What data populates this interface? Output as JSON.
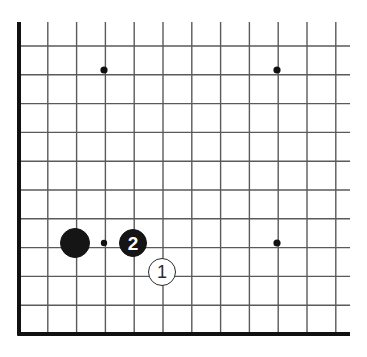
{
  "figure": {
    "type": "go-board-diagram",
    "title": "",
    "width": 367,
    "height": 357,
    "background_color": "#ffffff"
  },
  "board": {
    "line_color": "#5a5a5a",
    "edge_color": "#111111",
    "line_width": 1.4,
    "edge_line_width": 4,
    "spacing": 28.8,
    "origin_x": 19,
    "origin_y": 334,
    "visible_columns": 12,
    "visible_rows": 11,
    "edges_shown": [
      "left",
      "bottom"
    ],
    "grid_clip": {
      "top": 22,
      "right": 350,
      "left": 17,
      "bottom": 336
    },
    "star_points": [
      {
        "name": "star-point-top-left",
        "cx": 104,
        "cy": 70,
        "r": 3.6
      },
      {
        "name": "star-point-top-right",
        "cx": 277,
        "cy": 70,
        "r": 3.6
      },
      {
        "name": "star-point-bottom-left",
        "cx": 104,
        "cy": 243,
        "r": 3.2
      },
      {
        "name": "star-point-bottom-right",
        "cx": 277,
        "cy": 243,
        "r": 3.6
      }
    ],
    "star_point_color": "#111111"
  },
  "stones": [
    {
      "id": "stone-black-plain",
      "name": "black-stone",
      "color": "black",
      "label": "",
      "cx": 75,
      "cy": 243,
      "r": 15
    },
    {
      "id": "stone-black-2",
      "name": "black-stone-move-2",
      "color": "black",
      "label": "2",
      "cx": 133,
      "cy": 243,
      "r": 14
    },
    {
      "id": "stone-white-1",
      "name": "white-stone-move-1",
      "color": "white",
      "label": "1",
      "cx": 162,
      "cy": 272,
      "r": 14
    }
  ]
}
